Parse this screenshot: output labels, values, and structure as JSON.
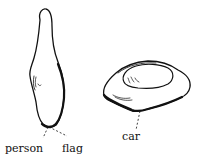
{
  "diagram": {
    "type": "labeled line drawing",
    "shapes": [
      {
        "id": "tall-stone",
        "description": "tall upright stone-like shape"
      },
      {
        "id": "flat-stone",
        "description": "flat oval stone with hollow top"
      }
    ],
    "labels": [
      {
        "id": "person",
        "text": "person",
        "points_to": "tall-stone"
      },
      {
        "id": "flag",
        "text": "flag",
        "points_to": "tall-stone"
      },
      {
        "id": "car",
        "text": "car",
        "points_to": "flat-stone"
      }
    ],
    "colors": {
      "ink": "#111111",
      "background": "#ffffff"
    }
  }
}
